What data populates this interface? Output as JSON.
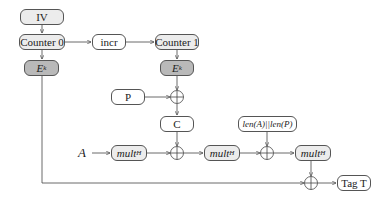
{
  "diagram": {
    "type": "GCM (Galois/Counter Mode) authenticated encryption flow",
    "nodes": {
      "iv": "IV",
      "counter0": "Counter 0",
      "incr": "incr",
      "counter1": "Counter 1",
      "ek0": "E",
      "ek0_sub": "k",
      "ek1": "E",
      "ek1_sub": "k",
      "plaintext": "P",
      "ciphertext": "C",
      "aad_label": "A",
      "mult1": "mult",
      "mult1_sub": "H",
      "mult2": "mult",
      "mult2_sub": "H",
      "mult3": "mult",
      "mult3_sub": "H",
      "lengths": "len(A)||len(P)",
      "tag": "Tag T"
    },
    "xor_symbol": "⊕",
    "colors": {
      "light_box": "#ececec",
      "dark_box": "#b9b9b9",
      "stroke": "#555555"
    }
  }
}
